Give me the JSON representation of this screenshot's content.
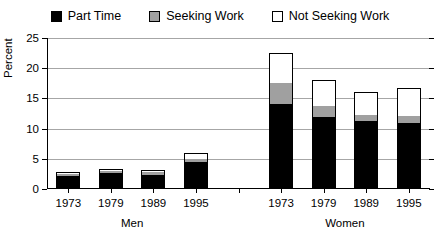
{
  "chart_data": {
    "type": "bar",
    "title": "",
    "xlabel": "",
    "ylabel": "Percent",
    "ylim": [
      0,
      25
    ],
    "yticks": [
      0,
      5,
      10,
      15,
      20,
      25
    ],
    "grid": true,
    "stacked": true,
    "legend_position": "top-center",
    "legend": [
      "Part Time",
      "Seeking Work",
      "Not Seeking Work"
    ],
    "groups": [
      "Men",
      "Women"
    ],
    "categories": [
      "1973",
      "1979",
      "1989",
      "1995",
      "",
      "1973",
      "1979",
      "1989",
      "1995"
    ],
    "series": [
      {
        "name": "Part Time",
        "color": "#000000",
        "values": [
          2.1,
          2.6,
          2.4,
          4.5,
          null,
          14.0,
          12.0,
          11.3,
          11.0
        ]
      },
      {
        "name": "Seeking Work",
        "color": "#a0a0a0",
        "values": [
          0.4,
          0.4,
          0.4,
          0.5,
          null,
          3.5,
          1.8,
          1.0,
          1.1
        ]
      },
      {
        "name": "Not Seeking Work",
        "color": "#ffffff",
        "values": [
          0.2,
          0.3,
          0.3,
          0.9,
          null,
          5.0,
          4.2,
          3.7,
          4.6
        ]
      }
    ],
    "totals": [
      2.7,
      3.3,
      3.1,
      5.9,
      null,
      22.5,
      18.0,
      16.0,
      16.7
    ]
  },
  "legend": {
    "items": [
      {
        "label": "Part Time",
        "swatch": "#000000"
      },
      {
        "label": "Seeking Work",
        "swatch": "#a0a0a0"
      },
      {
        "label": "Not Seeking Work",
        "swatch": "#ffffff"
      }
    ]
  },
  "axes": {
    "y_title": "Percent",
    "y_labels": [
      "25",
      "20",
      "15",
      "10",
      "5",
      "0"
    ],
    "x_labels": [
      "1973",
      "1979",
      "1989",
      "1995",
      "",
      "1973",
      "1979",
      "1989",
      "1995"
    ],
    "group_labels": [
      "Men",
      "Women"
    ]
  }
}
